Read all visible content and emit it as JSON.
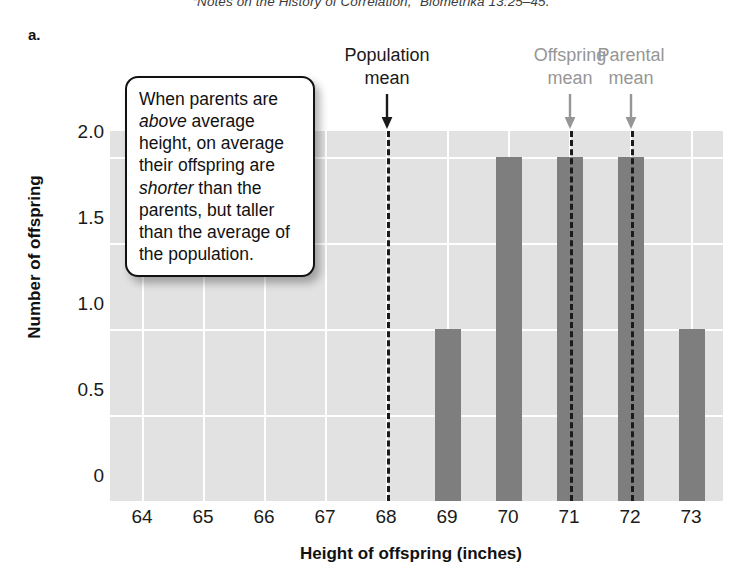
{
  "citation": {
    "text": "“Notes on the History of Correlation,” Biometrika 13:25–45."
  },
  "panel": {
    "letter": "a."
  },
  "callout": {
    "segments": [
      {
        "text": "When parents are ",
        "italic": false
      },
      {
        "text": "above",
        "italic": true
      },
      {
        "text": " average height, on average their offspring are ",
        "italic": false
      },
      {
        "text": "shorter",
        "italic": true
      },
      {
        "text": " than the parents, but taller than the average of the population.",
        "italic": false
      }
    ],
    "plain_text": "When parents are above average height, on average their offspring are shorter than the parents, but taller than the average of the population."
  },
  "annotations": [
    {
      "line1": "Population",
      "line2": "mean",
      "color": "#1a1a1a",
      "x_value": 68,
      "style": "dark"
    },
    {
      "line1": "Offspring",
      "line2": "mean",
      "color": "#969696",
      "x_value": 71,
      "style": "gray"
    },
    {
      "line1": "Parental",
      "line2": "mean",
      "color": "#969696",
      "x_value": 72,
      "style": "gray"
    }
  ],
  "chart_data": {
    "type": "bar",
    "title": "",
    "xlabel": "Height of offspring (inches)",
    "ylabel": "Number of offspring",
    "categories": [
      64,
      65,
      66,
      67,
      68,
      69,
      70,
      71,
      72,
      73
    ],
    "values": [
      0,
      0,
      0,
      0,
      0,
      1,
      2,
      2,
      2,
      1
    ],
    "xlim": [
      63.5,
      73.7
    ],
    "ylim": [
      0,
      2.15
    ],
    "ytick_labels": [
      "0",
      "0.5",
      "1.0",
      "1.5",
      "2.0"
    ],
    "ytick_values": [
      0,
      0.5,
      1.0,
      1.5,
      2.0
    ],
    "xtick_labels": [
      "64",
      "65",
      "66",
      "67",
      "68",
      "69",
      "70",
      "71",
      "72",
      "73"
    ],
    "grid": "white gridlines on gray panel",
    "legend": "none",
    "bar_color": "#7e7e7e",
    "panel_color": "#e2e2e2",
    "gridline_color": "#ffffff",
    "vlines": [
      {
        "label": "Population mean",
        "x_value": 68,
        "color": "#1b1b1b",
        "dash": true
      },
      {
        "label": "Offspring mean",
        "x_value": 71,
        "color": "#1b1b1b",
        "dash": true
      },
      {
        "label": "Parental mean",
        "x_value": 72,
        "color": "#1b1b1b",
        "dash": true
      }
    ]
  }
}
